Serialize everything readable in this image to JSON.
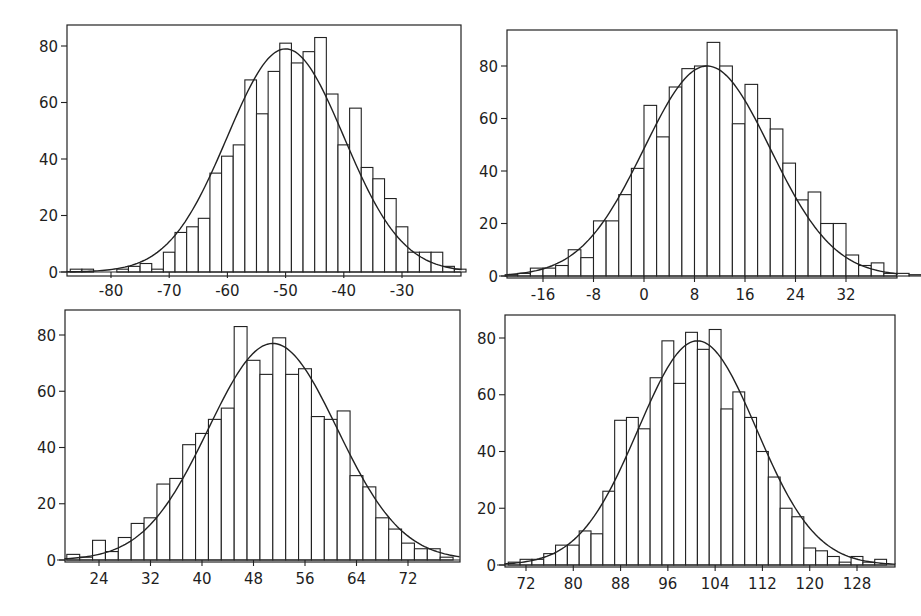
{
  "figure": {
    "layout": "2x2 grid of histograms with fitted normal curves",
    "colors": {
      "bar_fill": "#ffffff",
      "bar_stroke": "#222222",
      "curve": "#222222",
      "frame": "#222222",
      "background": "#ffffff"
    }
  },
  "chart_data": [
    {
      "id": "top-left",
      "type": "bar",
      "subtype": "histogram_with_normal_fit",
      "title": "",
      "xlabel": "",
      "ylabel": "",
      "bin_start": -87,
      "bin_width": 2,
      "values": [
        1,
        1,
        0,
        0,
        1,
        2,
        3,
        1,
        7,
        14,
        16,
        19,
        35,
        41,
        45,
        68,
        56,
        71,
        81,
        74,
        78,
        83,
        63,
        45,
        58,
        37,
        33,
        26,
        16,
        7,
        7,
        7,
        2,
        1
      ],
      "normal_fit": {
        "mean": -50,
        "sd": 10,
        "peak": 79
      },
      "xlim": [
        -88,
        -19
      ],
      "ylim": [
        0,
        86
      ],
      "xticks": [
        -80,
        -70,
        -60,
        -50,
        -40,
        -30
      ],
      "yticks": [
        0,
        20,
        40,
        60,
        80
      ],
      "grid": false,
      "legend": null,
      "frame": {
        "left": 67,
        "right": 461,
        "top": 25,
        "bottom": 276
      },
      "axis_map": {
        "x0_val": -80,
        "x0_px": 111,
        "x1_val": -30,
        "x1_px": 402,
        "y0_px": 272,
        "y80_px": 46
      }
    },
    {
      "id": "top-right",
      "type": "bar",
      "subtype": "histogram_with_normal_fit",
      "title": "",
      "xlabel": "",
      "ylabel": "",
      "bin_start": -22,
      "bin_width": 2,
      "values": [
        0.5,
        1,
        3,
        3,
        4,
        10,
        7,
        21,
        21,
        31,
        41,
        65,
        53,
        72,
        79,
        80,
        89,
        80,
        58,
        73,
        60,
        56,
        43,
        29,
        32,
        20,
        20,
        8,
        4,
        5,
        1,
        1,
        0.5
      ],
      "normal_fit": {
        "mean": 10,
        "sd": 10,
        "peak": 80
      },
      "xlim": [
        -22,
        44
      ],
      "ylim": [
        0,
        88
      ],
      "xticks": [
        -16,
        -8,
        0,
        8,
        16,
        24,
        32
      ],
      "yticks": [
        0,
        20,
        40,
        60,
        80
      ],
      "grid": false,
      "legend": null,
      "frame": {
        "left": 507,
        "right": 897,
        "top": 30,
        "bottom": 278
      },
      "axis_map": {
        "x0_val": -16,
        "x0_px": 543,
        "x1_val": 32,
        "x1_px": 846,
        "y0_px": 276,
        "y80_px": 66
      }
    },
    {
      "id": "bottom-left",
      "type": "bar",
      "subtype": "histogram_with_normal_fit",
      "title": "",
      "xlabel": "",
      "ylabel": "",
      "bin_start": 19,
      "bin_width": 2,
      "values": [
        2,
        1,
        7,
        3,
        8,
        13,
        15,
        27,
        29,
        41,
        45,
        50,
        54,
        83,
        71,
        66,
        79,
        66,
        68,
        51,
        50,
        53,
        30,
        26,
        15,
        11,
        6,
        4,
        4,
        1
      ],
      "normal_fit": {
        "mean": 51,
        "sd": 10,
        "peak": 77
      },
      "xlim": [
        18,
        80
      ],
      "ylim": [
        0,
        89
      ],
      "xticks": [
        24,
        32,
        40,
        48,
        56,
        64,
        72
      ],
      "yticks": [
        0,
        20,
        40,
        60,
        80
      ],
      "grid": false,
      "legend": null,
      "frame": {
        "left": 65,
        "right": 460,
        "top": 310,
        "bottom": 562
      },
      "axis_map": {
        "x0_val": 24,
        "x0_px": 99,
        "x1_val": 72,
        "x1_px": 408,
        "y0_px": 560,
        "y80_px": 335
      }
    },
    {
      "id": "bottom-right",
      "type": "bar",
      "subtype": "histogram_with_normal_fit",
      "title": "",
      "xlabel": "",
      "ylabel": "",
      "bin_start": 69,
      "bin_width": 2,
      "values": [
        1,
        2,
        2,
        4,
        7,
        7,
        12,
        11,
        26,
        51,
        52,
        48,
        66,
        79,
        64,
        82,
        76,
        83,
        55,
        61,
        52,
        40,
        31,
        20,
        17,
        6,
        5,
        3,
        1,
        3,
        1,
        2
      ],
      "normal_fit": {
        "mean": 101,
        "sd": 10,
        "peak": 79
      },
      "xlim": [
        67,
        135
      ],
      "ylim": [
        0,
        88
      ],
      "xticks": [
        72,
        80,
        88,
        96,
        104,
        112,
        120,
        128
      ],
      "yticks": [
        0,
        20,
        40,
        60,
        80
      ],
      "grid": false,
      "legend": null,
      "frame": {
        "left": 505,
        "right": 895,
        "top": 315,
        "bottom": 567
      },
      "axis_map": {
        "x0_val": 72,
        "x0_px": 526,
        "x1_val": 128,
        "x1_px": 857,
        "y0_px": 565,
        "y80_px": 338
      }
    }
  ]
}
